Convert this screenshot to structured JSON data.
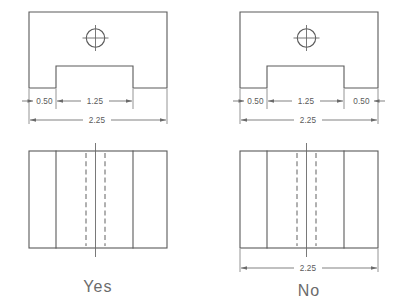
{
  "figure": {
    "background_color": "#ffffff",
    "line_color": "#5a5a5a",
    "text_color": "#6b6b6b"
  },
  "panels": [
    {
      "id": "left",
      "verdict": "Yes",
      "verdict_name": "verdict-yes",
      "top_view": {
        "name": "top-view-left",
        "hole": {
          "name": "hole-circle-left",
          "has_centermark": true
        }
      },
      "front_view": {
        "name": "front-view-left"
      },
      "dimensions": [
        {
          "name": "dim-left-050",
          "value": "0.50"
        },
        {
          "name": "dim-left-125",
          "value": "1.25"
        },
        {
          "name": "dim-left-225",
          "value": "2.25"
        }
      ],
      "front_dimensions": []
    },
    {
      "id": "right",
      "verdict": "No",
      "verdict_name": "verdict-no",
      "top_view": {
        "name": "top-view-right",
        "hole": {
          "name": "hole-circle-right",
          "has_centermark": true
        }
      },
      "front_view": {
        "name": "front-view-right"
      },
      "dimensions": [
        {
          "name": "dim-right-050-a",
          "value": "0.50"
        },
        {
          "name": "dim-right-125",
          "value": "1.25"
        },
        {
          "name": "dim-right-050-b",
          "value": "0.50"
        },
        {
          "name": "dim-right-225",
          "value": "2.25"
        }
      ],
      "front_dimensions": [
        {
          "name": "dim-right-front-225",
          "value": "2.25"
        }
      ]
    }
  ],
  "labels": {
    "left_050": "0.50",
    "left_125": "1.25",
    "left_225": "2.25",
    "right_050_a": "0.50",
    "right_125": "1.25",
    "right_050_b": "0.50",
    "right_225": "2.25",
    "right_front_225": "2.25",
    "yes": "Yes",
    "no": "No"
  }
}
